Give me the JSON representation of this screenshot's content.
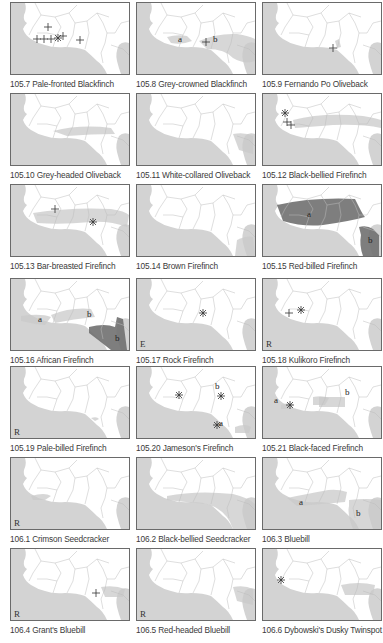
{
  "figure": {
    "layout": {
      "columns": 3,
      "rows": 7,
      "col_x": [
        10,
        136,
        262
      ],
      "row_y": [
        2,
        93,
        184,
        278,
        366,
        457,
        548
      ]
    },
    "colors": {
      "ocean": "#d3d3d3",
      "land": "#ffffff",
      "border": "#b8b8b8",
      "frame": "#6a6a6a",
      "range_light": "#c9c9c9",
      "range_dark": "#707070",
      "marker": "#333333"
    },
    "panels": [
      {
        "id": "105.7",
        "caption": "105.7 Pale-fronted Blackfinch",
        "corner": "",
        "ranges": [],
        "labels": [],
        "markers": [
          {
            "t": "plus",
            "x": 37,
            "y": 24
          },
          {
            "t": "plus",
            "x": 26,
            "y": 36
          },
          {
            "t": "plus",
            "x": 33,
            "y": 36
          },
          {
            "t": "plus",
            "x": 40,
            "y": 36
          },
          {
            "t": "star",
            "x": 47,
            "y": 35
          },
          {
            "t": "plus",
            "x": 52,
            "y": 33
          },
          {
            "t": "plus",
            "x": 69,
            "y": 37
          }
        ]
      },
      {
        "id": "105.8",
        "caption": "105.8 Grey-crowned Blackfinch",
        "corner": "",
        "ranges": [
          {
            "shade": "light",
            "d": "M30 34 Q40 31 50 33 L55 38 Q45 42 34 40 Z"
          },
          {
            "shade": "light",
            "d": "M62 38 Q80 30 100 31 Q112 33 118 36 L118 58 Q108 62 96 55 Q88 46 70 46 Z"
          }
        ],
        "labels": [
          {
            "text": "a",
            "x": 41,
            "y": 39
          },
          {
            "text": "b",
            "x": 76,
            "y": 39
          }
        ],
        "markers": [
          {
            "t": "plus",
            "x": 69,
            "y": 39
          }
        ]
      },
      {
        "id": "105.9",
        "caption": "105.9 Fernando Po Oliveback",
        "corner": "",
        "ranges": [
          {
            "shade": "light",
            "d": "M72 38 L76 36 L78 44 L74 45 Z"
          }
        ],
        "labels": [],
        "markers": [
          {
            "t": "plus",
            "x": 70,
            "y": 45
          }
        ]
      },
      {
        "id": "105.10",
        "caption": "105.10 Grey-headed Oliveback",
        "corner": "",
        "ranges": [
          {
            "shade": "light",
            "d": "M42 37 Q70 30 100 34 L104 40 Q80 40 56 42 Z"
          }
        ],
        "labels": [],
        "markers": []
      },
      {
        "id": "105.11",
        "caption": "105.11 White-collared Oliveback",
        "corner": "",
        "ranges": [
          {
            "shade": "light",
            "d": "M96 40 Q108 38 116 42 L116 60 L102 56 Z"
          }
        ],
        "labels": [],
        "markers": []
      },
      {
        "id": "105.12",
        "caption": "105.12 Black-bellied Firefinch",
        "corner": "",
        "ranges": [
          {
            "shade": "light",
            "d": "M30 26 Q60 18 100 22 Q112 24 118 26 L118 34 Q100 30 70 31 Q45 33 32 34 Z"
          }
        ],
        "labels": [],
        "markers": [
          {
            "t": "star",
            "x": 22,
            "y": 19
          },
          {
            "t": "plus",
            "x": 24,
            "y": 28
          },
          {
            "t": "plus",
            "x": 28,
            "y": 31
          }
        ]
      },
      {
        "id": "105.13",
        "caption": "105.13 Bar-breasted Firefinch",
        "corner": "",
        "ranges": [
          {
            "shade": "light",
            "d": "M22 28 Q60 22 100 24 Q114 26 118 30 L116 42 Q100 36 80 37 Q50 40 26 38 Z"
          }
        ],
        "labels": [],
        "markers": [
          {
            "t": "plus",
            "x": 44,
            "y": 24
          },
          {
            "t": "star",
            "x": 82,
            "y": 37
          }
        ]
      },
      {
        "id": "105.14",
        "caption": "105.14 Brown Firefinch",
        "corner": "",
        "ranges": [
          {
            "shade": "light",
            "d": "M100 55 Q110 50 116 52 L118 71 L98 71 Z"
          }
        ],
        "labels": [],
        "markers": []
      },
      {
        "id": "105.15",
        "caption": "105.15 Red-billed Firefinch",
        "corner": "",
        "ranges": [
          {
            "shade": "dark",
            "d": "M14 20 Q50 12 92 14 L96 22 Q100 30 102 32 Q88 36 60 40 Q40 42 20 36 Z"
          },
          {
            "shade": "dark",
            "d": "M96 42 Q104 40 110 44 L116 50 L116 71 L100 71 Q96 60 98 50 Z"
          }
        ],
        "labels": [
          {
            "text": "a",
            "x": 44,
            "y": 32
          },
          {
            "text": "b",
            "x": 105,
            "y": 58
          }
        ],
        "markers": []
      },
      {
        "id": "105.16",
        "caption": "105.16 African Firefinch",
        "corner": "",
        "ranges": [
          {
            "shade": "light",
            "d": "M10 37 Q30 34 40 38 L34 46 Q22 45 10 42 Z"
          },
          {
            "shade": "light",
            "d": "M40 36 Q60 28 80 30 L84 38 Q62 40 44 44 Z"
          },
          {
            "shade": "dark",
            "d": "M78 48 Q94 44 104 48 L106 38 L112 40 L116 71 L100 71 Q86 60 78 54 Z"
          }
        ],
        "labels": [
          {
            "text": "a",
            "x": 27,
            "y": 43
          },
          {
            "text": "b",
            "x": 76,
            "y": 38
          },
          {
            "text": "b",
            "x": 104,
            "y": 62
          }
        ],
        "markers": []
      },
      {
        "id": "105.17",
        "caption": "105.17 Rock Firefinch",
        "corner": "E",
        "ranges": [],
        "labels": [],
        "markers": [
          {
            "t": "star",
            "x": 66,
            "y": 34
          }
        ]
      },
      {
        "id": "105.18",
        "caption": "105.18 Kulikoro Firefinch",
        "corner": "R",
        "ranges": [],
        "labels": [],
        "markers": [
          {
            "t": "plus",
            "x": 26,
            "y": 34
          },
          {
            "t": "star",
            "x": 38,
            "y": 31
          }
        ]
      },
      {
        "id": "105.19",
        "caption": "105.19 Pale-billed Firefinch",
        "corner": "R",
        "ranges": [
          {
            "shade": "light",
            "d": "M80 51 Q86 49 88 52 L84 54 Z"
          }
        ],
        "labels": [],
        "markers": []
      },
      {
        "id": "105.20",
        "caption": "105.20 Jameson's Firefinch",
        "corner": "",
        "ranges": [
          {
            "shade": "light",
            "d": "M98 60 Q108 56 114 60 L112 66 L98 66 Z"
          }
        ],
        "labels": [
          {
            "text": "b",
            "x": 78,
            "y": 22
          },
          {
            "text": "a",
            "x": 82,
            "y": 59
          }
        ],
        "markers": [
          {
            "t": "star",
            "x": 42,
            "y": 28
          },
          {
            "t": "star",
            "x": 84,
            "y": 29
          },
          {
            "t": "star",
            "x": 80,
            "y": 58
          }
        ]
      },
      {
        "id": "105.21",
        "caption": "105.21 Black-faced Firefinch",
        "corner": "",
        "ranges": [
          {
            "shade": "light",
            "d": "M18 38 Q24 35 30 37 L28 42 L18 42 Z"
          },
          {
            "shade": "light",
            "d": "M50 30 Q60 28 66 31 L62 38 L50 38 Z"
          },
          {
            "shade": "light",
            "d": "M56 30 L82 30 L82 40 L56 40 Z"
          }
        ],
        "labels": [
          {
            "text": "a",
            "x": 11,
            "y": 36
          },
          {
            "text": "b",
            "x": 82,
            "y": 28
          }
        ],
        "markers": [
          {
            "t": "star",
            "x": 27,
            "y": 38
          }
        ]
      },
      {
        "id": "106.1",
        "caption": "106.1 Crimson Seedcracker",
        "corner": "R",
        "ranges": [
          {
            "shade": "light",
            "d": "M20 38 Q34 34 40 38 L34 42 L22 42 Z"
          }
        ],
        "labels": [],
        "markers": []
      },
      {
        "id": "106.2",
        "caption": "106.2 Black-bellied Seedcracker",
        "corner": "",
        "ranges": [
          {
            "shade": "light",
            "d": "M30 38 Q60 32 96 36 Q112 40 118 46 L118 71 L96 71 Q90 52 70 46 Q48 44 30 42 Z"
          }
        ],
        "labels": [],
        "markers": []
      },
      {
        "id": "106.3",
        "caption": "106.3 Bluebill",
        "corner": "",
        "ranges": [
          {
            "shade": "light",
            "d": "M24 40 Q44 36 60 33 Q72 30 84 34 L82 44 Q60 46 34 48 Z"
          },
          {
            "shade": "light",
            "d": "M86 42 Q104 40 118 42 L118 71 L90 71 Q84 56 86 48 Z"
          }
        ],
        "labels": [
          {
            "text": "a",
            "x": 36,
            "y": 47
          },
          {
            "text": "b",
            "x": 93,
            "y": 58
          }
        ],
        "markers": []
      },
      {
        "id": "106.4",
        "caption": "106.4 Grant's Bluebill",
        "corner": "R",
        "ranges": [
          {
            "shade": "light",
            "d": "M90 38 Q104 36 114 40 L112 48 L94 48 Z"
          }
        ],
        "labels": [],
        "markers": [
          {
            "t": "plus",
            "x": 85,
            "y": 44
          }
        ]
      },
      {
        "id": "106.5",
        "caption": "106.5 Red-headed Bluebill",
        "corner": "R",
        "ranges": [
          {
            "shade": "light",
            "d": "M96 38 Q108 36 116 40 L116 56 L100 52 Z"
          }
        ],
        "labels": [],
        "markers": []
      },
      {
        "id": "106.6",
        "caption": "106.6 Dybowski's Dusky Twinspot",
        "corner": "",
        "ranges": [
          {
            "shade": "light",
            "d": "M78 36 Q96 32 112 36 L110 46 L82 46 Z"
          }
        ],
        "labels": [],
        "markers": [
          {
            "t": "star",
            "x": 18,
            "y": 31
          }
        ]
      }
    ]
  }
}
